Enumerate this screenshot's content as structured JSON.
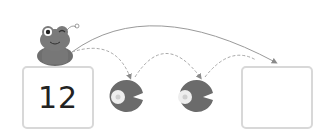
{
  "puzzle": {
    "start_value": "12",
    "end_value": "",
    "hops": 2
  },
  "colors": {
    "frog": "#6e6e6e",
    "lily_pad": "#6b6b6b",
    "box_border": "#d8d8d8",
    "arrow": "#8a8a8a",
    "flower": "#e8e8e8"
  },
  "icons": {
    "frog": "frog-icon",
    "lily_pad": "lily-pad-icon",
    "flower": "flower-icon"
  }
}
